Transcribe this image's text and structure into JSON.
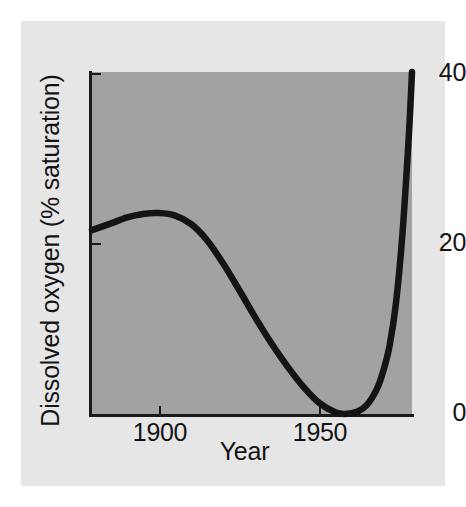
{
  "figure": {
    "background_color": "#ffffff",
    "card_color": "#e6e6e6",
    "plot_color": "#a2a2a2",
    "axis_color": "#1a1a1a",
    "curve_color": "#141414"
  },
  "chart_data": {
    "type": "line",
    "title": "",
    "subtitle": "",
    "xlabel": "Year",
    "ylabel": "Dissolved oxygen (% saturation)",
    "xlim": [
      1879,
      1979
    ],
    "ylim": [
      0,
      40
    ],
    "xticks": [
      1900,
      1950
    ],
    "xtick_labels": [
      "1900",
      "1950"
    ],
    "yticks": [
      0,
      20,
      40
    ],
    "ytick_labels": [
      "0",
      "20",
      "40"
    ],
    "grid": false,
    "legend": null,
    "legend_position": "none",
    "annotations": [],
    "series": [
      {
        "name": "Dissolved oxygen",
        "x": [
          1879,
          1885,
          1890,
          1895,
          1900,
          1905,
          1910,
          1915,
          1920,
          1925,
          1930,
          1935,
          1940,
          1945,
          1950,
          1955,
          1958,
          1962,
          1965,
          1968,
          1970,
          1972,
          1974,
          1976,
          1978,
          1979
        ],
        "y": [
          21.5,
          22.3,
          23.0,
          23.4,
          23.5,
          23.2,
          22.2,
          20.3,
          17.6,
          14.5,
          11.3,
          8.3,
          5.6,
          3.2,
          1.3,
          0.2,
          0.0,
          0.3,
          1.1,
          2.9,
          5.0,
          8.0,
          13.0,
          21.0,
          32.5,
          40.0
        ]
      }
    ]
  }
}
